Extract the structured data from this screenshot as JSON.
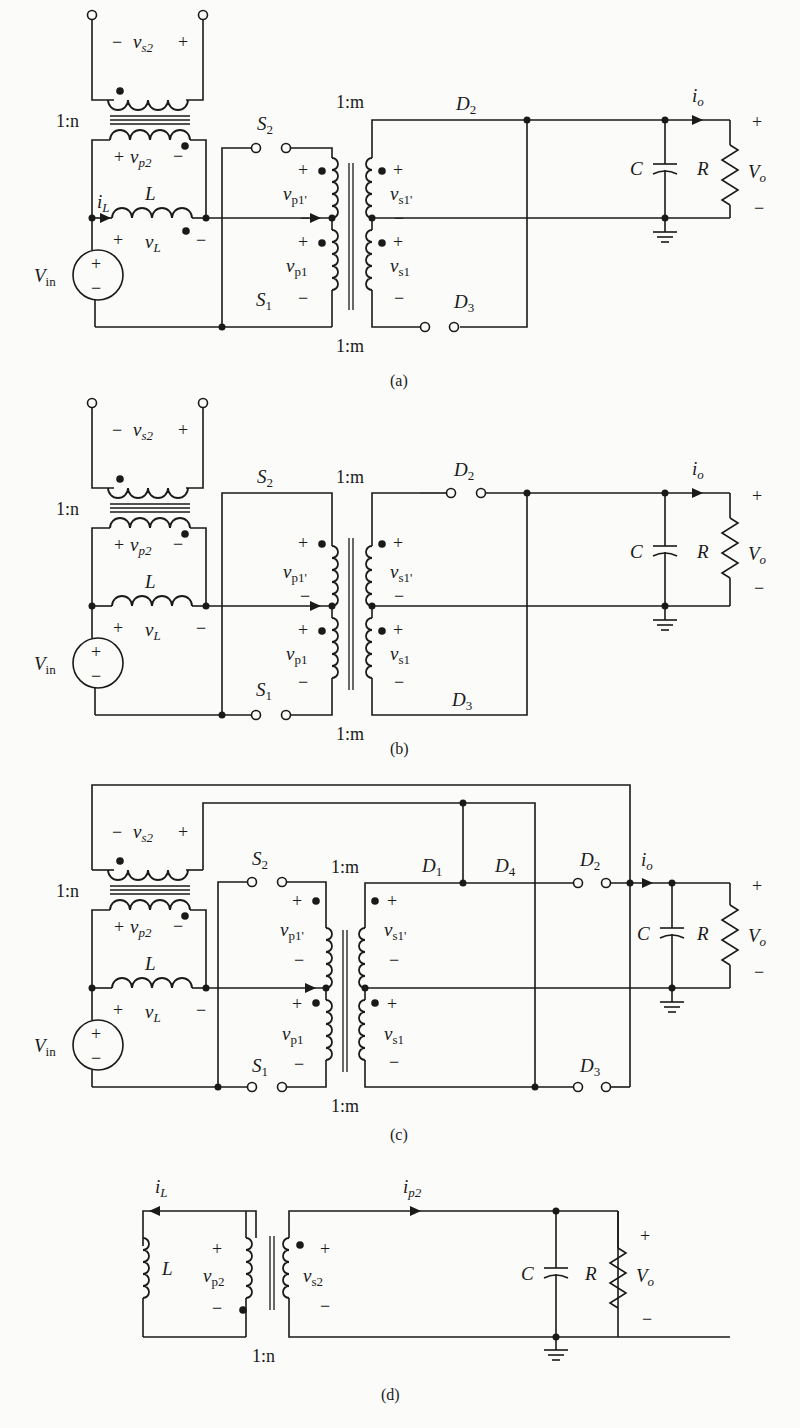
{
  "figure": {
    "colors": {
      "ink": "#1a1a1a",
      "background": "#fbfbfa"
    }
  },
  "circuits": [
    {
      "id": "a",
      "caption": "(a)",
      "labels": {
        "aux_ratio": "1:n",
        "main_ratio_top": "1:m",
        "main_ratio_bottom": "1:m",
        "vs2": "v",
        "vs2_sub": "s2",
        "vp2": "v",
        "vp2_sub": "p2",
        "iL": "i",
        "iL_sub": "L",
        "L": "L",
        "vL": "v",
        "vL_sub": "L",
        "Vin": "V",
        "Vin_sub": "in",
        "S1": "S",
        "S1_sub": "1",
        "S2": "S",
        "S2_sub": "2",
        "vp1p": "v",
        "vp1p_sub": "p1'",
        "vp1": "v",
        "vp1_sub": "p1",
        "vs1p": "v",
        "vs1p_sub": "s1'",
        "vs1": "v",
        "vs1_sub": "s1",
        "D2": "D",
        "D2_sub": "2",
        "D3": "D",
        "D3_sub": "3",
        "C": "C",
        "R": "R",
        "io": "i",
        "io_sub": "o",
        "Vo": "V",
        "Vo_sub": "o"
      }
    },
    {
      "id": "b",
      "caption": "(b)",
      "labels": {
        "aux_ratio": "1:n",
        "main_ratio_top": "1:m",
        "main_ratio_bottom": "1:m",
        "vs2": "v",
        "vs2_sub": "s2",
        "vp2": "v",
        "vp2_sub": "p2",
        "L": "L",
        "vL": "v",
        "vL_sub": "L",
        "Vin": "V",
        "Vin_sub": "in",
        "S1": "S",
        "S1_sub": "1",
        "S2": "S",
        "S2_sub": "2",
        "vp1p": "v",
        "vp1p_sub": "p1'",
        "vp1": "v",
        "vp1_sub": "p1",
        "vs1p": "v",
        "vs1p_sub": "s1'",
        "vs1": "v",
        "vs1_sub": "s1",
        "D2": "D",
        "D2_sub": "2",
        "D3": "D",
        "D3_sub": "3",
        "C": "C",
        "R": "R",
        "io": "i",
        "io_sub": "o",
        "Vo": "V",
        "Vo_sub": "o"
      }
    },
    {
      "id": "c",
      "caption": "(c)",
      "labels": {
        "aux_ratio": "1:n",
        "main_ratio_top": "1:m",
        "main_ratio_bottom": "1:m",
        "vs2": "v",
        "vs2_sub": "s2",
        "vp2": "v",
        "vp2_sub": "p2",
        "L": "L",
        "vL": "v",
        "vL_sub": "L",
        "Vin": "V",
        "Vin_sub": "in",
        "S1": "S",
        "S1_sub": "1",
        "S2": "S",
        "S2_sub": "2",
        "vp1p": "v",
        "vp1p_sub": "p1'",
        "vp1": "v",
        "vp1_sub": "p1",
        "vs1p": "v",
        "vs1p_sub": "s1'",
        "vs1": "v",
        "vs1_sub": "s1",
        "D1": "D",
        "D1_sub": "1",
        "D2": "D",
        "D2_sub": "2",
        "D3": "D",
        "D3_sub": "3",
        "D4": "D",
        "D4_sub": "4",
        "C": "C",
        "R": "R",
        "io": "i",
        "io_sub": "o",
        "Vo": "V",
        "Vo_sub": "o"
      }
    },
    {
      "id": "d",
      "caption": "(d)",
      "labels": {
        "ratio": "1:n",
        "iL": "i",
        "iL_sub": "L",
        "ip2": "i",
        "ip2_sub": "p2",
        "L": "L",
        "vp2": "v",
        "vp2_sub": "p2",
        "vs2": "v",
        "vs2_sub": "s2",
        "C": "C",
        "R": "R",
        "Vo": "V",
        "Vo_sub": "o"
      }
    }
  ],
  "signs": {
    "plus": "+",
    "minus": "−"
  }
}
